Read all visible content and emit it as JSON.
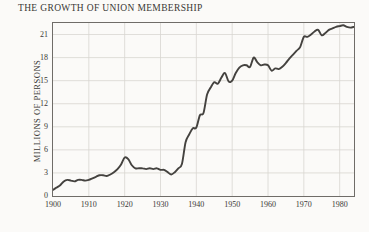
{
  "chart_data": {
    "type": "line",
    "title": "THE GROWTH OF UNION MEMBERSHIP",
    "xlabel": "",
    "ylabel": "MILLIONS OF PERSONS",
    "xlim": [
      1900,
      1984
    ],
    "ylim": [
      0,
      22.5
    ],
    "yticks": [
      0,
      3,
      6,
      9,
      12,
      15,
      18,
      21
    ],
    "xticks": [
      1900,
      1910,
      1920,
      1930,
      1940,
      1950,
      1960,
      1970,
      1980
    ],
    "grid": true,
    "legend": "none",
    "line_color": "#44423f",
    "background_color": "#fbfaf8",
    "grid_color": "#d8d5d0",
    "axis_color": "#6f6c68",
    "series": [
      {
        "name": "Union membership",
        "x": [
          1900,
          1901,
          1902,
          1903,
          1904,
          1905,
          1906,
          1907,
          1908,
          1909,
          1910,
          1911,
          1912,
          1913,
          1914,
          1915,
          1916,
          1917,
          1918,
          1919,
          1920,
          1921,
          1922,
          1923,
          1924,
          1925,
          1926,
          1927,
          1928,
          1929,
          1930,
          1931,
          1932,
          1933,
          1934,
          1935,
          1936,
          1937,
          1938,
          1939,
          1940,
          1941,
          1942,
          1943,
          1944,
          1945,
          1946,
          1947,
          1948,
          1949,
          1950,
          1951,
          1952,
          1953,
          1954,
          1955,
          1956,
          1957,
          1958,
          1959,
          1960,
          1961,
          1962,
          1963,
          1964,
          1965,
          1966,
          1967,
          1968,
          1969,
          1970,
          1971,
          1972,
          1973,
          1974,
          1975,
          1976,
          1977,
          1978,
          1979,
          1980,
          1981,
          1982,
          1983,
          1984
        ],
        "y": [
          0.8,
          1.1,
          1.4,
          1.9,
          2.1,
          2.0,
          1.9,
          2.1,
          2.1,
          2.0,
          2.1,
          2.3,
          2.5,
          2.7,
          2.7,
          2.6,
          2.8,
          3.1,
          3.5,
          4.1,
          5.0,
          4.8,
          4.0,
          3.6,
          3.6,
          3.6,
          3.5,
          3.6,
          3.5,
          3.6,
          3.4,
          3.4,
          3.1,
          2.8,
          3.1,
          3.6,
          4.2,
          7.0,
          8.0,
          8.8,
          8.9,
          10.5,
          10.8,
          13.2,
          14.1,
          14.8,
          14.6,
          15.4,
          16.0,
          14.9,
          15.0,
          16.0,
          16.7,
          17.0,
          17.0,
          16.8,
          18.0,
          17.4,
          17.0,
          17.1,
          17.0,
          16.3,
          16.6,
          16.5,
          16.8,
          17.3,
          17.9,
          18.4,
          18.9,
          19.4,
          20.7,
          20.7,
          21.0,
          21.4,
          21.6,
          20.9,
          21.2,
          21.6,
          21.8,
          22.0,
          22.1,
          22.2,
          22.0,
          21.9,
          22.0
        ]
      }
    ]
  }
}
